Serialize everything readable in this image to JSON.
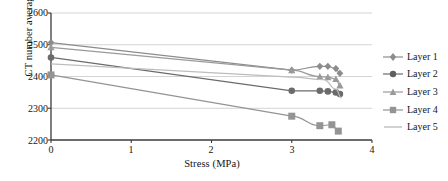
{
  "chart_data": {
    "type": "line",
    "title": "",
    "xlabel": "Stress (MPa)",
    "ylabel": "CT number average value",
    "xlim": [
      0,
      4
    ],
    "ylim": [
      2200,
      2600
    ],
    "xticks": [
      0,
      1,
      2,
      3,
      4
    ],
    "yticks": [
      2200,
      2300,
      2400,
      2500,
      2600
    ],
    "xtick_labels": [
      "0",
      "1",
      "2",
      "3",
      "4"
    ],
    "ytick_labels": [
      "2200",
      "2300",
      "2400",
      "2500",
      "2600"
    ],
    "grid": "horizontal",
    "legend_position": "right",
    "series": [
      {
        "name": "Layer 1",
        "marker": "diamond",
        "color": "#8c8c8c",
        "x": [
          0,
          3.0,
          3.35,
          3.45,
          3.55,
          3.6
        ],
        "y": [
          2507,
          2420,
          2432,
          2432,
          2425,
          2410
        ]
      },
      {
        "name": "Layer 2",
        "marker": "circle",
        "color": "#6b6b6b",
        "x": [
          0,
          3.0,
          3.35,
          3.45,
          3.55,
          3.6
        ],
        "y": [
          2460,
          2355,
          2355,
          2353,
          2350,
          2345
        ]
      },
      {
        "name": "Layer 3",
        "marker": "triangle",
        "color": "#9a9a9a",
        "x": [
          0,
          3.0,
          3.35,
          3.45,
          3.55,
          3.6
        ],
        "y": [
          2492,
          2420,
          2400,
          2398,
          2392,
          2372
        ]
      },
      {
        "name": "Layer 4",
        "marker": "square",
        "color": "#949494",
        "x": [
          0,
          3.0,
          3.35,
          3.5,
          3.58
        ],
        "y": [
          2405,
          2275,
          2245,
          2248,
          2228
        ]
      },
      {
        "name": "Layer 5",
        "marker": "none",
        "color": "#bdbdbd",
        "x": [
          0,
          3.0,
          3.4,
          3.55,
          3.62
        ],
        "y": [
          2440,
          2398,
          2390,
          2360,
          2332
        ]
      }
    ]
  },
  "legend": {
    "items": [
      {
        "label": "Layer 1"
      },
      {
        "label": "Layer 2"
      },
      {
        "label": "Layer 3"
      },
      {
        "label": "Layer 4"
      },
      {
        "label": "Layer 5"
      }
    ]
  },
  "axes": {
    "y_title": "CT number average value",
    "x_title": "Stress (MPa)"
  }
}
